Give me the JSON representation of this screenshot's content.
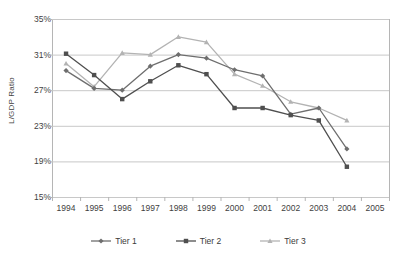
{
  "chart_data": {
    "type": "line",
    "title": "",
    "xlabel": "",
    "ylabel": "L/GDP Ratio",
    "categories": [
      "1994",
      "1995",
      "1996",
      "1997",
      "1998",
      "1999",
      "2000",
      "2001",
      "2002",
      "2003",
      "2004",
      "2005"
    ],
    "x_tick_labels": [
      "1994",
      "1995",
      "1996",
      "1997",
      "1998",
      "1999",
      "2000",
      "2001",
      "2002",
      "2003",
      "2004",
      "2005"
    ],
    "y_tick_labels": [
      "35%",
      "31%",
      "27%",
      "23%",
      "19%",
      "15%"
    ],
    "y_tick_values": [
      35,
      31,
      27,
      23,
      19,
      15
    ],
    "ylim": [
      15,
      35
    ],
    "y_unit": "%",
    "grid": "horizontal",
    "legend_position": "bottom",
    "series": [
      {
        "name": "Tier 1",
        "marker": "diamond",
        "color": "#6e6e6e",
        "values": [
          29.2,
          27.2,
          27.0,
          29.7,
          31.0,
          30.6,
          29.3,
          28.6,
          24.3,
          25.0,
          20.4,
          null
        ]
      },
      {
        "name": "Tier 2",
        "marker": "square",
        "color": "#4f4f4f",
        "values": [
          31.1,
          28.7,
          26.0,
          28.0,
          29.8,
          28.8,
          25.0,
          25.0,
          24.2,
          23.6,
          18.4,
          null
        ]
      },
      {
        "name": "Tier 3",
        "marker": "triangle",
        "color": "#b3b3b3",
        "values": [
          30.0,
          27.4,
          31.2,
          31.0,
          33.0,
          32.4,
          28.8,
          27.5,
          25.7,
          25.0,
          23.6,
          null
        ]
      }
    ]
  },
  "legend": {
    "items": [
      {
        "label": "Tier 1"
      },
      {
        "label": "Tier 2"
      },
      {
        "label": "Tier 3"
      }
    ]
  },
  "colors": {
    "tier1": "#6e6e6e",
    "tier2": "#4f4f4f",
    "tier3": "#b3b3b3",
    "gridline": "#c8c8c8",
    "axis": "#b5b5b5",
    "text": "#3f3f3f",
    "background": "#ffffff"
  }
}
